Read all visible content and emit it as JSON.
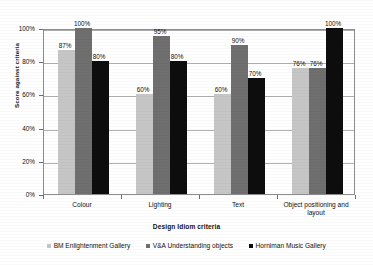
{
  "chart_data": {
    "type": "bar",
    "title": "",
    "xlabel": "Design Idiom criteria",
    "ylabel": "Score against criteria",
    "categories": [
      "Colour",
      "Lighting",
      "Text",
      "Object positioning and layout"
    ],
    "series": [
      {
        "name": "BM Enlightenment Gallery",
        "color": "#c6c6c6",
        "values": [
          87,
          60,
          60,
          76
        ]
      },
      {
        "name": "V&A Understanding objects",
        "color": "#6f6f6f",
        "values": [
          100,
          95,
          90,
          76
        ]
      },
      {
        "name": "Horniman Music Gallery",
        "color": "#0d0d0d",
        "values": [
          80,
          80,
          70,
          100
        ]
      }
    ],
    "data_labels": [
      [
        "87%",
        "100%",
        "80%"
      ],
      [
        "60%",
        "95%",
        "80%"
      ],
      [
        "60%",
        "90%",
        "70%"
      ],
      [
        "76%",
        "76%",
        "100%"
      ]
    ],
    "ylim": [
      0,
      100
    ],
    "ytick_labels": [
      "0%",
      "20%",
      "40%",
      "60%",
      "80%",
      "100%"
    ],
    "ytick_values": [
      0,
      20,
      40,
      60,
      80,
      100
    ],
    "grid": "horizontal",
    "legend_position": "bottom"
  }
}
